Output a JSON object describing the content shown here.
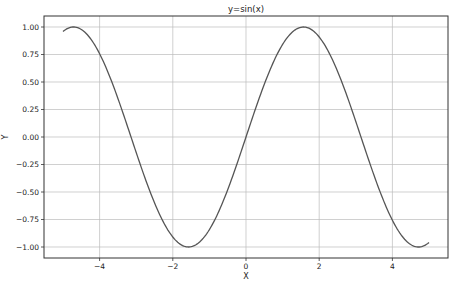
{
  "chart_data": {
    "type": "line",
    "title": "y=sin(x)",
    "xlabel": "X",
    "ylabel": "Y",
    "xlim": [
      -5.3,
      5.3
    ],
    "ylim": [
      -1.1,
      1.1
    ],
    "grid": true,
    "x_ticks": [
      "-4",
      "-2",
      "0",
      "2",
      "4"
    ],
    "x_tick_values": [
      -4,
      -2,
      0,
      2,
      4
    ],
    "y_ticks": [
      "1.00",
      "0.75",
      "0.50",
      "0.25",
      "0.00",
      "-0.25",
      "-0.50",
      "-0.75",
      "-1.00"
    ],
    "y_tick_values": [
      1.0,
      0.75,
      0.5,
      0.25,
      0.0,
      -0.25,
      -0.5,
      -0.75,
      -1.0
    ],
    "series": [
      {
        "name": "sin(x)",
        "function": "sin",
        "x_range": [
          -5,
          5
        ],
        "color": "#555555"
      }
    ]
  }
}
